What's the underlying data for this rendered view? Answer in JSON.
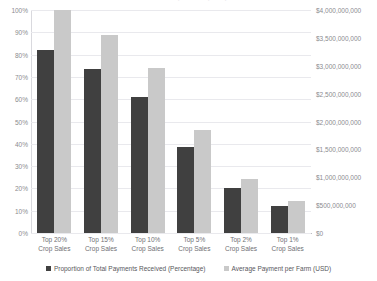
{
  "chart_data": {
    "type": "bar",
    "title": "Concentration of Farm Payments by Crop Sales Percentile",
    "xlabel": "",
    "ylabel": "",
    "grid": true,
    "legend_position": "bottom",
    "categories": [
      "Top 20%\nCrop Sales",
      "Top 15%\nCrop Sales",
      "Top 10%\nCrop Sales",
      "Top 5%\nCrop Sales",
      "Top 2%\nCrop Sales",
      "Top 1%\nCrop Sales"
    ],
    "series": [
      {
        "name": "Proportion of Total Payments Received (Percentage)",
        "axis": "left",
        "color": "#404040",
        "values": [
          82,
          73.5,
          61,
          38.5,
          20,
          12
        ]
      },
      {
        "name": "Average Payment per Farm (USD)",
        "axis": "right",
        "color": "#c9c9c9",
        "values": [
          4000000000,
          3560000000,
          2960000000,
          1840000000,
          960000000,
          580000000
        ]
      }
    ],
    "left_axis": {
      "ylim": [
        0,
        100
      ],
      "tick_labels": [
        "100%",
        "90%",
        "80%",
        "70%",
        "60%",
        "50%",
        "40%",
        "30%",
        "20%",
        "10%",
        "0%"
      ],
      "tick_values": [
        100,
        90,
        80,
        70,
        60,
        50,
        40,
        30,
        20,
        10,
        0
      ]
    },
    "right_axis": {
      "ylim": [
        0,
        4000000000
      ],
      "tick_labels": [
        "$4,000,000,000",
        "$3,500,000,000",
        "$3,000,000,000",
        "$2,500,000,000",
        "$2,000,000,000",
        "$1,500,000,000",
        "$1,000,000,000",
        "$500,000,000",
        "$0"
      ],
      "tick_values": [
        4000000000,
        3500000000,
        3000000000,
        2500000000,
        2000000000,
        1500000000,
        1000000000,
        500000000,
        0
      ]
    }
  },
  "legend": {
    "items": [
      {
        "label": "Proportion of Total Payments Received (Percentage)",
        "color": "#404040"
      },
      {
        "label": "Average Payment per Farm (USD)",
        "color": "#c9c9c9"
      }
    ]
  }
}
